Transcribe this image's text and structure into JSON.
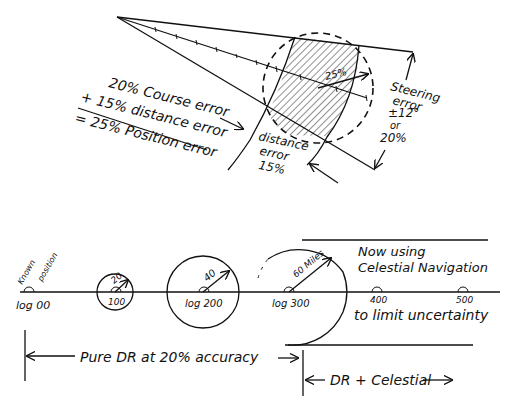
{
  "top_diagram": {
    "formula": {
      "line1": "20% Course error",
      "line2": "+ 15% distance error",
      "line3": "= 25% Position error"
    },
    "labels": {
      "radius": "25%",
      "distance_error": [
        "distance",
        "error",
        "15%"
      ],
      "steering_error": [
        "Steering",
        "error",
        "±12°",
        "or",
        "20%"
      ]
    }
  },
  "bottom_diagram": {
    "known_position": [
      "Known",
      "position"
    ],
    "positions": [
      {
        "label": "log 00",
        "radius_label": ""
      },
      {
        "label": "100",
        "radius_label": "20"
      },
      {
        "label": "log 200",
        "radius_label": "40"
      },
      {
        "label": "log 300",
        "radius_label": "60 Miles"
      },
      {
        "label": "400",
        "radius_label": ""
      },
      {
        "label": "500",
        "radius_label": ""
      }
    ],
    "celestial_note": [
      "Now using",
      "Celestial Navigation",
      "to limit uncertainty"
    ],
    "span_pure_dr": "Pure DR at 20% accuracy",
    "span_dr_celestial": "DR + Celestial"
  }
}
